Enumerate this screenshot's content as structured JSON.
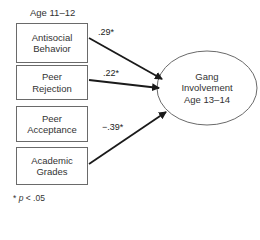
{
  "diagram": {
    "predictor_group_label": "Age 11–12",
    "predictors": [
      {
        "id": "antisocial-behavior",
        "label": "Antisocial\nBehavior",
        "coefficient": ".29*",
        "has_path": true
      },
      {
        "id": "peer-rejection",
        "label": "Peer\nRejection",
        "coefficient": ".22*",
        "has_path": true
      },
      {
        "id": "peer-acceptance",
        "label": "Peer\nAcceptance",
        "coefficient": "",
        "has_path": false
      },
      {
        "id": "academic-grades",
        "label": "Academic\nGrades",
        "coefficient": "−.39*",
        "has_path": true
      }
    ],
    "outcome": {
      "label": "Gang\nInvolvement\nAge 13–14",
      "shape": "ellipse"
    },
    "footnote": {
      "symbol": "*",
      "p_var": "p",
      "text": " < .05"
    },
    "colors": {
      "line": "#1a1a1a",
      "border": "#6a6a6a",
      "text": "#333333"
    }
  }
}
